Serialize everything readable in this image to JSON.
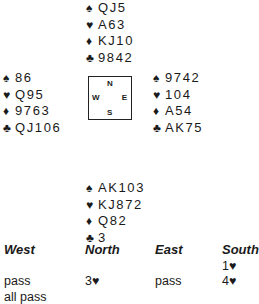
{
  "hands": {
    "north": {
      "spades": "QJ5",
      "hearts": "A63",
      "diamonds": "KJ10",
      "clubs": "9842"
    },
    "west": {
      "spades": "86",
      "hearts": "Q95",
      "diamonds": "9763",
      "clubs": "QJ106"
    },
    "east": {
      "spades": "9742",
      "hearts": "104",
      "diamonds": "A54",
      "clubs": "AK75"
    },
    "south": {
      "spades": "AK103",
      "hearts": "KJ872",
      "diamonds": "Q82",
      "clubs": "3"
    }
  },
  "suit_symbols": {
    "spades": "♠",
    "hearts": "♥",
    "diamonds": "♦",
    "clubs": "♣"
  },
  "compass": {
    "n": "N",
    "w": "W",
    "e": "E",
    "s": "S"
  },
  "auction": {
    "headers": {
      "west": "West",
      "north": "North",
      "east": "East",
      "south": "South"
    },
    "calls": [
      {
        "seat": "south",
        "row": 0,
        "text": "1♥"
      },
      {
        "seat": "west",
        "row": 1,
        "text": "pass"
      },
      {
        "seat": "north",
        "row": 1,
        "text": "3♥"
      },
      {
        "seat": "east",
        "row": 1,
        "text": "pass"
      },
      {
        "seat": "south",
        "row": 1,
        "text": "4♥"
      },
      {
        "seat": "west",
        "row": 2,
        "text": "all pass"
      }
    ]
  }
}
